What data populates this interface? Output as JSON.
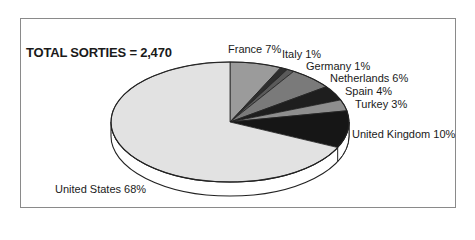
{
  "chart_data": {
    "type": "pie",
    "title": "TOTAL SORTIES = 2,470",
    "total": 2470,
    "style": "3d",
    "start_angle": "12 o'clock",
    "direction": "clockwise",
    "categories": [
      "France",
      "Italy",
      "Germany",
      "Netherlands",
      "Spain",
      "Turkey",
      "United Kingdom",
      "United States"
    ],
    "values": [
      7,
      1,
      1,
      6,
      4,
      3,
      10,
      68
    ],
    "unit": "%",
    "labels": [
      "France 7%",
      "Italy 1%",
      "Germany 1%",
      "Netherlands 6%",
      "Spain 4%",
      "Turkey 3%",
      "United Kingdom 10%",
      "United States 68%"
    ],
    "colors": [
      "#9b9b9b",
      "#2e2e2e",
      "#5a5a5a",
      "#7a7a7a",
      "#1e1e1e",
      "#8e8e8e",
      "#161616",
      "#e2e2e2"
    ],
    "legend": "none (direct labels)"
  },
  "label_positions": [
    {
      "left": 228,
      "top": 43
    },
    {
      "left": 282,
      "top": 48
    },
    {
      "left": 306,
      "top": 60
    },
    {
      "left": 330,
      "top": 72
    },
    {
      "left": 345,
      "top": 85
    },
    {
      "left": 355,
      "top": 98
    },
    {
      "left": 352,
      "top": 128
    },
    {
      "left": 55,
      "top": 183
    }
  ]
}
